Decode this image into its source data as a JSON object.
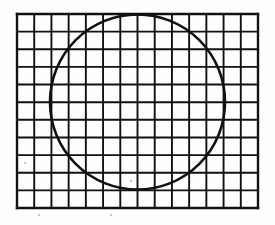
{
  "figure": {
    "title": "Square grid with inscribed circle",
    "background_color": "#fefefe",
    "ink_color": "#111111",
    "grid": {
      "columns": 14,
      "rows": 11,
      "x": 17,
      "y": 14,
      "width": 241,
      "height": 194,
      "cell_width": 17.2,
      "cell_height": 17.6,
      "line_width": 1.9,
      "border_line_width": 2.4,
      "line_color": "#111111"
    },
    "circle": {
      "center_x": 137.5,
      "center_y": 102,
      "radius": 87.5,
      "stroke_width": 2.6,
      "stroke_color": "#111111",
      "fill": "none"
    },
    "artifacts": [
      {
        "name": "speck-left",
        "x": 25,
        "y": 163,
        "size": 2.2
      },
      {
        "name": "speck-below-left",
        "x": 39,
        "y": 215,
        "size": 1.8
      },
      {
        "name": "speck-below-center",
        "x": 111,
        "y": 215,
        "size": 1.8
      },
      {
        "name": "speck-inner-center",
        "x": 131,
        "y": 181,
        "size": 1.6
      }
    ]
  }
}
